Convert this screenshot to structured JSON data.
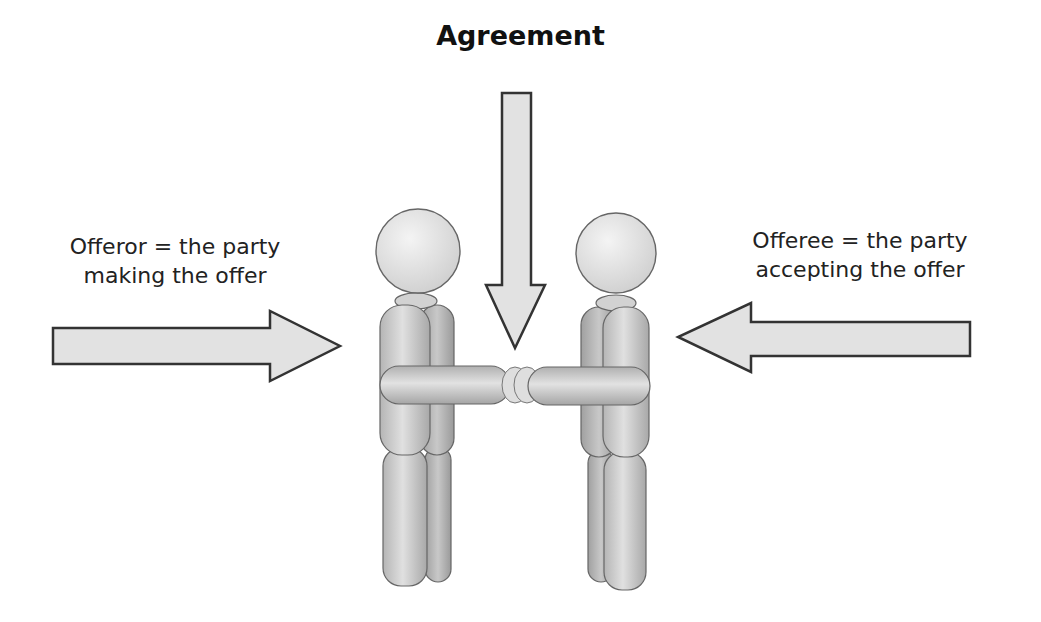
{
  "diagram": {
    "title": "Agreement",
    "left_label": {
      "line1": "Offeror = the party",
      "line2": "making the offer"
    },
    "right_label": {
      "line1": "Offeree = the party",
      "line2": "accepting the offer"
    },
    "arrows": [
      {
        "id": "offeror-arrow",
        "direction": "right"
      },
      {
        "id": "agreement-arrow",
        "direction": "down"
      },
      {
        "id": "offeree-arrow",
        "direction": "left"
      }
    ],
    "figures": [
      {
        "id": "offeror-figure",
        "role": "offeror"
      },
      {
        "id": "offeree-figure",
        "role": "offeree"
      }
    ],
    "colors": {
      "arrow_fill": "#e2e2e2",
      "outline": "#333333",
      "figure_light": "#e6e6e6",
      "figure_dark": "#a9a9a9"
    }
  }
}
